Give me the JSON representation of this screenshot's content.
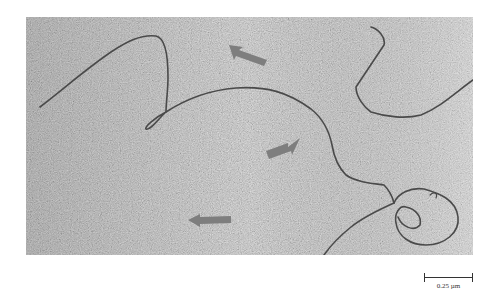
{
  "figure": {
    "type": "electron micrograph",
    "colors": {
      "background_light": "#c9c9c9",
      "background_dark": "#a8a8a8",
      "strand": "#4a4a4a",
      "arrow": "#7e7e7e",
      "page": "#ffffff"
    },
    "arrows": [
      {
        "id": "arrow-top",
        "x": 225,
        "y": 55,
        "direction": "up-left"
      },
      {
        "id": "arrow-middle",
        "x": 265,
        "y": 155,
        "direction": "up-right"
      },
      {
        "id": "arrow-bottom",
        "x": 190,
        "y": 219,
        "direction": "left"
      }
    ],
    "scale_bar": {
      "label": "0.25 µm",
      "length_px": 49
    }
  }
}
